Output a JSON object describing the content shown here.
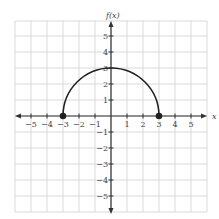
{
  "chart_data": {
    "type": "line",
    "title": "",
    "xlabel": "x",
    "ylabel": "f(x)",
    "xlim": [
      -6,
      6
    ],
    "ylim": [
      -6,
      6
    ],
    "grid": true,
    "x_ticks": [
      "-5",
      "-4",
      "-3",
      "-2",
      "-1",
      "1",
      "2",
      "3",
      "4",
      "5"
    ],
    "y_ticks": [
      "5",
      "4",
      "3",
      "2",
      "1",
      "-1",
      "-2",
      "-3",
      "-4",
      "-5"
    ],
    "series": [
      {
        "name": "semicircle",
        "description": "Upper semicircle of radius 3 centered at origin, f(x) = sqrt(9 - x^2)",
        "x": [
          -3,
          -2,
          -1,
          0,
          1,
          2,
          3
        ],
        "y": [
          0,
          2.24,
          2.83,
          3,
          2.83,
          2.24,
          0
        ]
      }
    ],
    "endpoints": [
      {
        "x": -3,
        "y": 0,
        "style": "closed"
      },
      {
        "x": 3,
        "y": 0,
        "style": "closed"
      }
    ]
  },
  "labels": {
    "x_axis": "x",
    "y_axis": "f(x)"
  },
  "x_ticks": [
    {
      "v": -5,
      "label": "−5"
    },
    {
      "v": -4,
      "label": "−4"
    },
    {
      "v": -3,
      "label": "−3"
    },
    {
      "v": -2,
      "label": "−2"
    },
    {
      "v": -1,
      "label": "−1"
    },
    {
      "v": 1,
      "label": "1"
    },
    {
      "v": 2,
      "label": "2"
    },
    {
      "v": 3,
      "label": "3"
    },
    {
      "v": 4,
      "label": "4"
    },
    {
      "v": 5,
      "label": "5"
    }
  ],
  "y_ticks": [
    {
      "v": 5,
      "label": "5"
    },
    {
      "v": 4,
      "label": "4"
    },
    {
      "v": 3,
      "label": "3"
    },
    {
      "v": 2,
      "label": "2"
    },
    {
      "v": 1,
      "label": "1"
    },
    {
      "v": -1,
      "label": "−1"
    },
    {
      "v": -2,
      "label": "−2"
    },
    {
      "v": -3,
      "label": "−3"
    },
    {
      "v": -4,
      "label": "−4"
    },
    {
      "v": -5,
      "label": "−5"
    }
  ],
  "colors": {
    "grid": "#d9d9d9",
    "axis": "#333333",
    "curve": "#222222"
  }
}
